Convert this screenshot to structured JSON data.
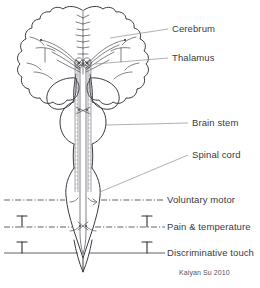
{
  "figure": {
    "background_color": "#ffffff",
    "outline_color": "#3b3b42",
    "leader_color": "#8e8e96",
    "text_color": "#3a3a41",
    "credit": "Kaiyan Su 2010"
  },
  "labels": [
    {
      "id": "cerebrum",
      "text": "Cerebrum",
      "x": 172,
      "y": 29
    },
    {
      "id": "thalamus",
      "text": "Thalamus",
      "x": 172,
      "y": 58
    },
    {
      "id": "brain-stem",
      "text": "Brain stem",
      "x": 192,
      "y": 123
    },
    {
      "id": "spinal-cord",
      "text": "Spinal cord",
      "x": 192,
      "y": 155
    },
    {
      "id": "voluntary-motor",
      "text": "Voluntary motor",
      "x": 167,
      "y": 196
    },
    {
      "id": "pain-temperature",
      "text": "Pain & temperature",
      "x": 167,
      "y": 223
    },
    {
      "id": "discriminative-touch",
      "text": "Discriminative touch",
      "x": 167,
      "y": 249
    }
  ],
  "levels": [
    {
      "id": "voluntary-motor",
      "name": "Voluntary motor",
      "y": 200,
      "style": "dash-dot",
      "receptors": 0
    },
    {
      "id": "pain-temperature",
      "name": "Pain & temperature",
      "y": 227,
      "style": "dash-dot",
      "receptors": 2
    },
    {
      "id": "discriminative-touch",
      "name": "Discriminative touch",
      "y": 253,
      "style": "solid",
      "receptors": 2
    }
  ],
  "structures": [
    {
      "id": "cerebrum",
      "name": "Cerebrum"
    },
    {
      "id": "thalamus",
      "name": "Thalamus"
    },
    {
      "id": "brain-stem",
      "name": "Brain stem"
    },
    {
      "id": "spinal-cord",
      "name": "Spinal cord"
    }
  ]
}
